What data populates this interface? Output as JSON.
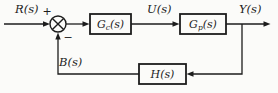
{
  "diagram": {
    "kind": "closed-loop feedback control system block diagram",
    "colors": {
      "background": "#fbfbf9",
      "line": "#1c1c1c"
    },
    "signals": {
      "input": "R(s)",
      "plus": "+",
      "minus": "−",
      "control": "U(s)",
      "output": "Y(s)",
      "feedback": "B(s)"
    },
    "blocks": {
      "controller": {
        "base": "G",
        "sub": "c",
        "args": "(s)"
      },
      "plant": {
        "base": "G",
        "sub": "p",
        "args": "(s)"
      },
      "sensor": {
        "label": "H(s)"
      }
    }
  }
}
